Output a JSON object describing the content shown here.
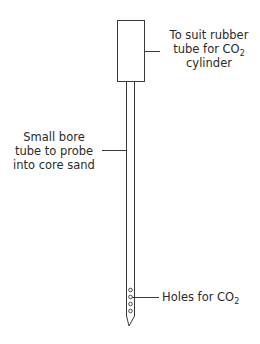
{
  "diagram": {
    "components": [
      {
        "id": "connector",
        "label_lines": [
          "To suit rubber",
          "tube for CO",
          "cylinder"
        ],
        "subscript": "2"
      },
      {
        "id": "tube",
        "label_lines": [
          "Small bore",
          "tube to probe",
          "into core sand"
        ]
      },
      {
        "id": "holes",
        "label_text": "Holes for CO",
        "subscript": "2"
      }
    ],
    "colors": {
      "line": "#3a3a3a",
      "background": "#ffffff"
    }
  }
}
